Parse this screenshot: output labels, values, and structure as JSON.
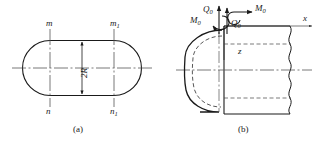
{
  "figure": {
    "stroke_color": "#1a1a1a",
    "centerline_color": "#555555",
    "dashed_color": "#444444"
  },
  "panel_a": {
    "caption": "(a)",
    "name": "stadium-cross-section",
    "dimension_label": "2R",
    "section_labels": {
      "top_left": "m",
      "top_right_base": "m",
      "top_right_sub": "1",
      "bottom_left": "n",
      "bottom_right_base": "n",
      "bottom_right_sub": "1"
    }
  },
  "panel_b": {
    "caption": "(b)",
    "name": "shell-edge-load-diagram",
    "axes": {
      "x_label": "x",
      "z_label": "z"
    },
    "loads": [
      {
        "id": "shear-left",
        "base": "Q",
        "sub": "0"
      },
      {
        "id": "moment-left",
        "base": "M",
        "sub": "0"
      },
      {
        "id": "moment-right",
        "base": "M",
        "sub": "0"
      },
      {
        "id": "shear-right",
        "base": "Q",
        "sub": "0"
      }
    ]
  }
}
